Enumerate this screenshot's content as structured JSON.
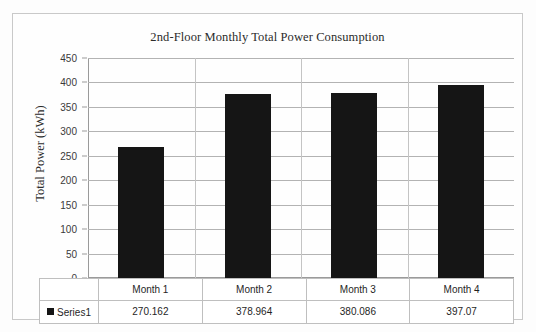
{
  "chart_data": {
    "type": "bar",
    "title": "2nd-Floor Monthly Total Power Consumption",
    "xlabel": "",
    "ylabel": "Total Power (kWh)",
    "categories": [
      "Month 1",
      "Month 2",
      "Month 3",
      "Month 4"
    ],
    "series": [
      {
        "name": "Series1",
        "values": [
          270.162,
          378.964,
          380.086,
          397.07
        ],
        "color": "#151515"
      }
    ],
    "value_labels": [
      "270.162",
      "378.964",
      "380.086",
      "397.07"
    ],
    "ylim": [
      0,
      450
    ],
    "ytick_step": 50,
    "yticks": [
      0,
      50,
      100,
      150,
      200,
      250,
      300,
      350,
      400,
      450
    ],
    "ytick_labels": [
      "0",
      "50",
      "100",
      "150",
      "200",
      "250",
      "300",
      "350",
      "400",
      "450"
    ],
    "grid": true,
    "grid_axis": "y",
    "legend": true,
    "legend_position": "data-table",
    "data_table_visible": true,
    "bar_color": "#151515",
    "gridline_color": "#b3b3b3",
    "border_color": "#c9c9c9",
    "background_color": "#fefefe"
  },
  "legend": {
    "swatch_name": "series1-swatch",
    "label": "Series1"
  },
  "table": {
    "header_row": [
      "Month 1",
      "Month 2",
      "Month 3",
      "Month 4"
    ],
    "value_row": [
      "270.162",
      "378.964",
      "380.086",
      "397.07"
    ]
  }
}
